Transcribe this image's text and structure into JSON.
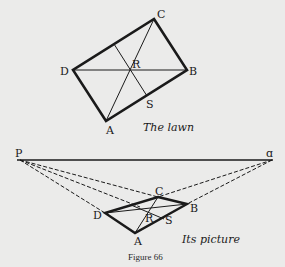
{
  "top_figure": {
    "caption": "The lawn",
    "labels": {
      "A": "A",
      "B": "B",
      "C": "C",
      "D": "D",
      "R": "R",
      "S": "S"
    }
  },
  "bottom_figure": {
    "caption": "Its picture",
    "labels": {
      "P": "P",
      "Q": "ɑ",
      "A": "A",
      "B": "B",
      "C": "C",
      "D": "D",
      "R": "R",
      "S": "S"
    }
  },
  "figure_label": "Figure 66",
  "colors": {
    "background": "#ebebea",
    "ink": "#1a1a1a"
  }
}
